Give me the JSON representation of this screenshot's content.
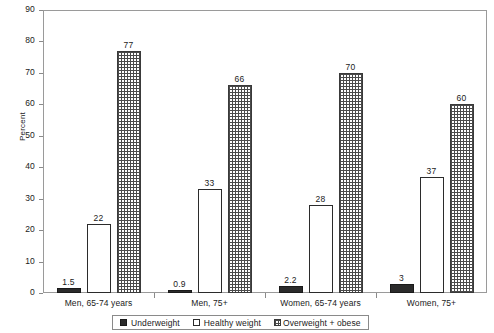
{
  "chart_data": {
    "type": "bar",
    "title": "",
    "subtitle": "",
    "xlabel": "",
    "ylabel": "Percent",
    "ylim": [
      0,
      90
    ],
    "ytick_step": 10,
    "yticks": [
      0,
      10,
      20,
      30,
      40,
      50,
      60,
      70,
      80,
      90
    ],
    "grid": false,
    "legend_position": "bottom",
    "categories": [
      "Men, 65-74 years",
      "Men, 75+",
      "Women, 65-74 years",
      "Women, 75+"
    ],
    "series": [
      {
        "name": "Underweight",
        "pattern": "solid-black",
        "values": [
          1.5,
          0.9,
          2.2,
          3
        ],
        "labels": [
          "1.5",
          "0.9",
          "2.2",
          "3"
        ]
      },
      {
        "name": "Healthy weight",
        "pattern": "white-outline",
        "values": [
          22,
          33,
          28,
          37
        ],
        "labels": [
          "22",
          "33",
          "28",
          "37"
        ]
      },
      {
        "name": "Overweight + obese",
        "pattern": "cross-hatch",
        "values": [
          77,
          66,
          70,
          60
        ],
        "labels": [
          "77",
          "66",
          "70",
          "60"
        ]
      }
    ]
  },
  "axis": {
    "y_title": "Percent",
    "y_tick_labels": [
      "90",
      "80",
      "70",
      "60",
      "50",
      "40",
      "30",
      "20",
      "10",
      "0"
    ]
  },
  "legend": {
    "items": [
      {
        "label": "Underweight",
        "swatch": "solid-black-square-icon"
      },
      {
        "label": "Healthy weight",
        "swatch": "white-square-icon"
      },
      {
        "label": "Overweight + obese",
        "swatch": "cross-hatch-square-icon"
      }
    ]
  },
  "colors": {
    "underweight": "#2b2b2b",
    "healthy": "#ffffff",
    "overweight_hatch": "#4a4a4a",
    "axis": "#8a8a8a",
    "text": "#1a1a1a"
  }
}
